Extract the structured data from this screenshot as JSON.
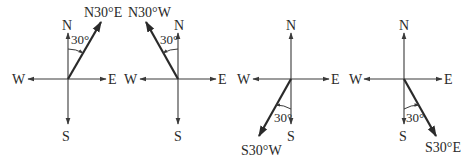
{
  "diagram": {
    "compass_labels": {
      "north": "N",
      "south": "S",
      "east": "E",
      "west": "W"
    },
    "panels": [
      {
        "id": "n30e",
        "bearing_label": "N30°E",
        "angle_label": "30°",
        "reference": "N",
        "deviation": "E"
      },
      {
        "id": "n30w",
        "bearing_label": "N30°W",
        "angle_label": "30°",
        "reference": "N",
        "deviation": "W"
      },
      {
        "id": "s30w",
        "bearing_label": "S30°W",
        "angle_label": "30°",
        "reference": "S",
        "deviation": "W"
      },
      {
        "id": "s30e",
        "bearing_label": "S30°E",
        "angle_label": "30°",
        "reference": "S",
        "deviation": "E"
      }
    ]
  }
}
